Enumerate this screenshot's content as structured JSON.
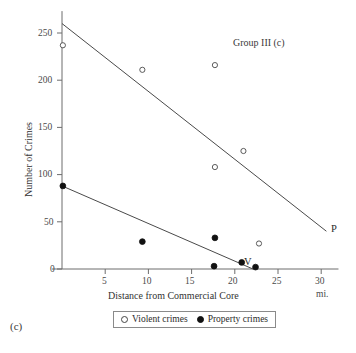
{
  "figure": {
    "panel_tag": "(c)",
    "group_title": "Group III (c)"
  },
  "axes": {
    "xlabel": "Distance from Commercial Core",
    "xunit": "mi.",
    "ylabel": "Number of Crimes",
    "xticks": [
      "5",
      "10",
      "15",
      "20",
      "25",
      "30"
    ],
    "yticks": [
      "0",
      "50",
      "100",
      "150",
      "200",
      "250"
    ]
  },
  "legend": {
    "violent_label": "Violent crimes",
    "property_label": "Property crimes",
    "violent_marker": "open-circle-icon",
    "property_marker": "filled-circle-icon"
  },
  "annotations": {
    "violent_line_tag": "V",
    "property_line_tag": "P"
  },
  "colors": {
    "axis": "#6d6d6d",
    "line": "#4a4a4a",
    "open_marker_stroke": "#4a4a4a",
    "filled_marker": "#111111",
    "text": "#3a3a3a",
    "background": "#ffffff"
  },
  "chart_data": {
    "type": "scatter",
    "title": "Group III (c)",
    "xlabel": "Distance from Commercial Core",
    "xunit": "mi.",
    "ylabel": "Number of Crimes",
    "xlim": [
      0,
      32
    ],
    "ylim": [
      0,
      270
    ],
    "xticks": [
      5,
      10,
      15,
      20,
      25,
      30
    ],
    "yticks": [
      0,
      50,
      100,
      150,
      200,
      250
    ],
    "grid": false,
    "legend_position": "below-plot",
    "series": [
      {
        "name": "Violent crimes",
        "marker": "open-circle",
        "tag": "V",
        "points": [
          {
            "x": 0.1,
            "y": 237
          },
          {
            "x": 9.3,
            "y": 211
          },
          {
            "x": 17.7,
            "y": 216
          },
          {
            "x": 17.7,
            "y": 108
          },
          {
            "x": 21.0,
            "y": 125
          },
          {
            "x": 22.8,
            "y": 27
          }
        ],
        "trendline": {
          "x0": 0.0,
          "y0": 260,
          "x1": 30.6,
          "y1": 40
        }
      },
      {
        "name": "Property crimes",
        "marker": "filled-circle",
        "tag": "P",
        "points": [
          {
            "x": 0.1,
            "y": 88
          },
          {
            "x": 9.3,
            "y": 29
          },
          {
            "x": 17.7,
            "y": 33
          },
          {
            "x": 17.6,
            "y": 3
          },
          {
            "x": 20.8,
            "y": 7
          },
          {
            "x": 22.4,
            "y": 2
          }
        ],
        "trendline": {
          "x0": 0.0,
          "y0": 88,
          "x1": 22.1,
          "y1": 0
        }
      }
    ]
  }
}
